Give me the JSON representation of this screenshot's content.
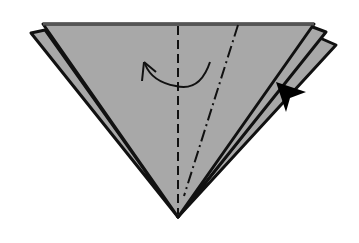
{
  "diagram": {
    "type": "origami-step",
    "colors": {
      "paper": "#a8a8a8",
      "outline": "#111111",
      "background": "#ffffff"
    },
    "elements": {
      "front_layer": "front-paper-layer",
      "back_left_flap": "back-left-flap",
      "back_right_flaps": [
        "back-right-flap-1",
        "back-right-flap-2"
      ],
      "valley_fold": "center-valley-fold-line",
      "mountain_fold": "mountain-fold-line",
      "curved_arrow": "fold-over-arrow",
      "push_arrow": "push-arrow"
    }
  }
}
